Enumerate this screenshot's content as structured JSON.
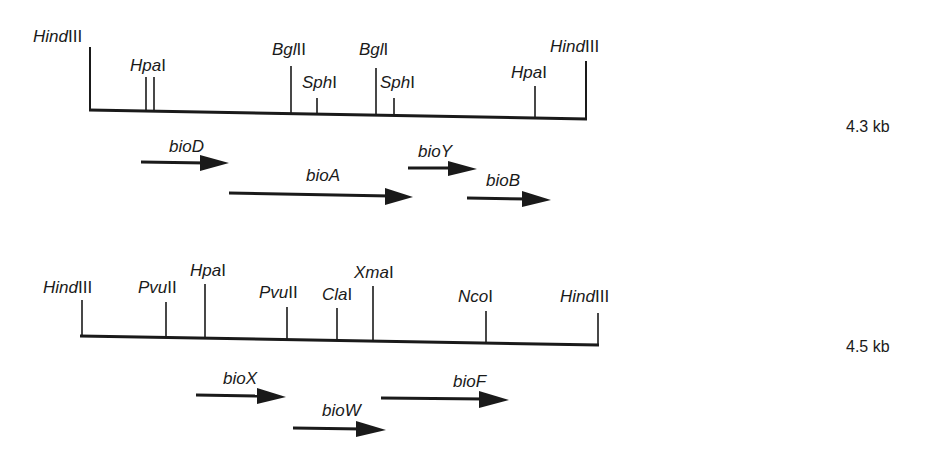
{
  "maps": [
    {
      "name": "fragment-1",
      "size_label": "4.3 kb",
      "sites": [
        {
          "enzyme_italic": "Hind",
          "enzyme_roman": "III",
          "x": 90
        },
        {
          "enzyme_italic": "Hpa",
          "enzyme_roman": "I",
          "x": 145
        },
        {
          "enzyme_italic": "Bgl",
          "enzyme_roman": "II",
          "x": 291
        },
        {
          "enzyme_italic": "Sph",
          "enzyme_roman": "I",
          "x": 317
        },
        {
          "enzyme_italic": "Bgl",
          "enzyme_roman": "I",
          "x": 376
        },
        {
          "enzyme_italic": "Sph",
          "enzyme_roman": "I",
          "x": 394
        },
        {
          "enzyme_italic": "Hpa",
          "enzyme_roman": "I",
          "x": 535
        },
        {
          "enzyme_italic": "Hind",
          "enzyme_roman": "III",
          "x": 586
        }
      ],
      "genes": [
        {
          "label": "bioD",
          "x1": 141,
          "x2": 229
        },
        {
          "label": "bioA",
          "x1": 229,
          "x2": 413
        },
        {
          "label": "bioY",
          "x1": 408,
          "x2": 477
        },
        {
          "label": "bioB",
          "x1": 467,
          "x2": 551
        }
      ]
    },
    {
      "name": "fragment-2",
      "size_label": "4.5 kb",
      "sites": [
        {
          "enzyme_italic": "Hind",
          "enzyme_roman": "III",
          "x": 81
        },
        {
          "enzyme_italic": "Pvu",
          "enzyme_roman": "II",
          "x": 166
        },
        {
          "enzyme_italic": "Hpa",
          "enzyme_roman": "I",
          "x": 204
        },
        {
          "enzyme_italic": "Pvu",
          "enzyme_roman": "II",
          "x": 287
        },
        {
          "enzyme_italic": "Cla",
          "enzyme_roman": "I",
          "x": 337
        },
        {
          "enzyme_italic": "Xma",
          "enzyme_roman": "I",
          "x": 373
        },
        {
          "enzyme_italic": "Nco",
          "enzyme_roman": "I",
          "x": 486
        },
        {
          "enzyme_italic": "Hind",
          "enzyme_roman": "III",
          "x": 598
        }
      ],
      "genes": [
        {
          "label": "bioX",
          "x1": 196,
          "x2": 286
        },
        {
          "label": "bioW",
          "x1": 293,
          "x2": 386
        },
        {
          "label": "bioF",
          "x1": 381,
          "x2": 509
        }
      ]
    }
  ]
}
